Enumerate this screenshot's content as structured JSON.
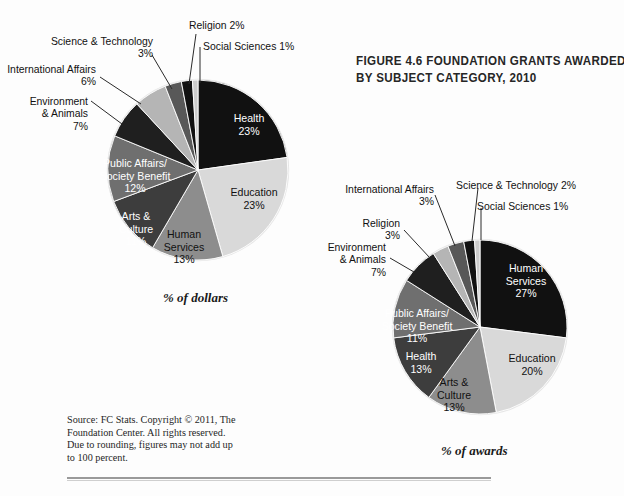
{
  "figure": {
    "title_lines": [
      "FIGURE 4.6 FOUNDATION GRANTS AWARDED",
      "BY SUBJECT CATEGORY, 2010"
    ],
    "source_lines": [
      "Source: FC Stats. Copyright © 2011, The",
      "Foundation Center. All rights reserved.",
      "Due to rounding, figures may not add up",
      "to 100 percent."
    ]
  },
  "captions": {
    "dollars": "% of dollars",
    "awards": "% of awards"
  },
  "palette": {
    "black": "#111111",
    "very_light": "#d9d9d9",
    "mid_gray": "#8d8d8d",
    "dark_gray": "#3d3d3d",
    "gray": "#6f6f6f",
    "light_gray": "#b5b5b5",
    "near_black": "#1f1f1f",
    "dim_gray": "#585858",
    "pale": "#cccccc"
  },
  "chart_data": [
    {
      "type": "pie",
      "title": "% of dollars",
      "id": "dollars",
      "start_angle_deg": 0,
      "categories": [
        "Health",
        "Education",
        "Human Services",
        "Arts & Culture",
        "Public Affairs/Society Benefit",
        "Environment & Animals",
        "International Affairs",
        "Science & Technology",
        "Religion",
        "Social Sciences"
      ],
      "values": [
        23,
        23,
        13,
        11,
        12,
        7,
        6,
        3,
        2,
        1
      ],
      "labels": [
        {
          "name": "Health",
          "pct": "23%",
          "value": 23,
          "placement": "inside",
          "color": "#111111",
          "text_color": "light"
        },
        {
          "name": "Education",
          "pct": "23%",
          "value": 23,
          "placement": "inside",
          "color": "#d9d9d9",
          "text_color": "dark"
        },
        {
          "name": "Human Services",
          "pct": "13%",
          "value": 13,
          "placement": "inside",
          "color": "#8d8d8d",
          "text_color": "dark"
        },
        {
          "name": "Arts & Culture",
          "pct": "11%",
          "value": 11,
          "placement": "inside",
          "color": "#3d3d3d",
          "text_color": "light"
        },
        {
          "name": "Public Affairs/ Society Benefit",
          "pct": "12%",
          "value": 12,
          "placement": "inside",
          "color": "#6f6f6f",
          "text_color": "light"
        },
        {
          "name": "Environment & Animals",
          "pct": "7%",
          "value": 7,
          "placement": "outside",
          "color": "#1f1f1f"
        },
        {
          "name": "International Affairs",
          "pct": "6%",
          "value": 6,
          "placement": "outside",
          "color": "#b5b5b5"
        },
        {
          "name": "Science & Technology",
          "pct": "3%",
          "value": 3,
          "placement": "outside",
          "color": "#585858"
        },
        {
          "name": "Religion",
          "pct": "2%",
          "value": 2,
          "placement": "outside",
          "color": "#111111"
        },
        {
          "name": "Social Sciences",
          "pct": "1%",
          "value": 1,
          "placement": "outside",
          "color": "#cccccc"
        }
      ]
    },
    {
      "type": "pie",
      "title": "% of awards",
      "id": "awards",
      "start_angle_deg": 0,
      "categories": [
        "Human Services",
        "Education",
        "Arts & Culture",
        "Health",
        "Public Affairs/Society Benefit",
        "Environment & Animals",
        "Religion",
        "International Affairs",
        "Science & Technology",
        "Social Sciences"
      ],
      "values": [
        27,
        20,
        13,
        13,
        11,
        7,
        3,
        3,
        2,
        1
      ],
      "labels": [
        {
          "name": "Human Services",
          "pct": "27%",
          "value": 27,
          "placement": "inside",
          "color": "#111111",
          "text_color": "light"
        },
        {
          "name": "Education",
          "pct": "20%",
          "value": 20,
          "placement": "inside",
          "color": "#d9d9d9",
          "text_color": "dark"
        },
        {
          "name": "Arts & Culture",
          "pct": "13%",
          "value": 13,
          "placement": "inside",
          "color": "#8d8d8d",
          "text_color": "dark"
        },
        {
          "name": "Health",
          "pct": "13%",
          "value": 13,
          "placement": "inside",
          "color": "#3d3d3d",
          "text_color": "light"
        },
        {
          "name": "Public Affairs/ Society Benefit",
          "pct": "11%",
          "value": 11,
          "placement": "inside",
          "color": "#6f6f6f",
          "text_color": "light"
        },
        {
          "name": "Environment & Animals",
          "pct": "7%",
          "value": 7,
          "placement": "outside",
          "color": "#1f1f1f"
        },
        {
          "name": "Religion",
          "pct": "3%",
          "value": 3,
          "placement": "outside",
          "color": "#b5b5b5"
        },
        {
          "name": "International Affairs",
          "pct": "3%",
          "value": 3,
          "placement": "outside",
          "color": "#585858"
        },
        {
          "name": "Science & Technology",
          "pct": "2%",
          "value": 2,
          "placement": "outside",
          "color": "#111111"
        },
        {
          "name": "Social Sciences",
          "pct": "1%",
          "value": 1,
          "placement": "outside",
          "color": "#cccccc"
        }
      ]
    }
  ],
  "pie1": {
    "labels": {
      "health_name": "Health",
      "health_pct": "23%",
      "education_name": "Education",
      "education_pct": "23%",
      "human_services_name": "Human",
      "human_services_name2": "Services",
      "human_services_pct": "13%",
      "arts_name": "Arts &",
      "arts_name2": "Culture",
      "arts_pct": "11%",
      "public_affairs_name": "Public Affairs/",
      "public_affairs_name2": "Society Benefit",
      "public_affairs_pct": "12%",
      "environment_name": "Environment",
      "environment_name2": "& Animals",
      "environment_pct": "7%",
      "international_name": "International Affairs",
      "international_pct": "6%",
      "science_name": "Science & Technology",
      "science_pct": "3%",
      "religion_name": "Religion 2%",
      "social_name": "Social Sciences 1%"
    }
  },
  "pie2": {
    "labels": {
      "human_services_name": "Human",
      "human_services_name2": "Services",
      "human_services_pct": "27%",
      "education_name": "Education",
      "education_pct": "20%",
      "arts_name": "Arts &",
      "arts_name2": "Culture",
      "arts_pct": "13%",
      "health_name": "Health",
      "health_pct": "13%",
      "public_affairs_name": "Public Affairs/",
      "public_affairs_name2": "Society Benefit",
      "public_affairs_pct": "11%",
      "environment_name": "Environment",
      "environment_name2": "& Animals",
      "environment_pct": "7%",
      "religion_name": "Religion",
      "religion_pct": "3%",
      "international_name": "International Affairs",
      "international_pct": "3%",
      "science_name": "Science & Technology 2%",
      "social_name": "Social Sciences 1%"
    }
  }
}
